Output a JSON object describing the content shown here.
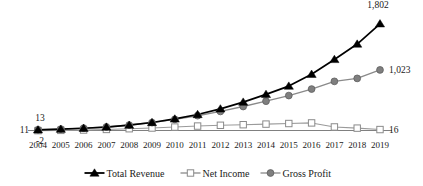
{
  "chart_data": {
    "type": "line",
    "title": "",
    "subtitle": "",
    "xlabel": "",
    "ylabel": "",
    "grid": false,
    "legend_position": "bottom",
    "categories": [
      "2004",
      "2005",
      "2006",
      "2007",
      "2008",
      "2009",
      "2010",
      "2011",
      "2012",
      "2013",
      "2014",
      "2015",
      "2016",
      "2017",
      "2018",
      "2019"
    ],
    "xlim": [
      "2004",
      "2019"
    ],
    "ylim": [
      -100,
      1900
    ],
    "series": [
      {
        "name": "Total Revenue",
        "marker": "triangle",
        "color": "#000000",
        "values": [
          11,
          22,
          38,
          58,
          90,
          135,
          195,
          270,
          365,
          480,
          610,
          750,
          950,
          1200,
          1460,
          1802
        ]
      },
      {
        "name": "Net Income",
        "marker": "square",
        "color": "#9a9a9a",
        "values": [
          -2,
          2,
          8,
          18,
          30,
          42,
          58,
          75,
          88,
          98,
          108,
          118,
          128,
          60,
          40,
          16
        ]
      },
      {
        "name": "Gross Profit",
        "marker": "circle",
        "color": "#7f7f7f",
        "values": [
          13,
          24,
          40,
          60,
          92,
          134,
          188,
          250,
          322,
          405,
          495,
          590,
          700,
          830,
          880,
          1023
        ]
      }
    ],
    "point_labels": [
      {
        "id": "revenue-start",
        "series": "Total Revenue",
        "category": "2004",
        "text": "11",
        "position": "left"
      },
      {
        "id": "gross-start",
        "series": "Gross Profit",
        "category": "2004",
        "text": "13",
        "position": "above"
      },
      {
        "id": "net-start",
        "series": "Net Income",
        "category": "2004",
        "text": "-2",
        "position": "below"
      },
      {
        "id": "revenue-end",
        "series": "Total Revenue",
        "category": "2019",
        "text": "1,802",
        "position": "above"
      },
      {
        "id": "gross-end",
        "series": "Gross Profit",
        "category": "2019",
        "text": "1,023",
        "position": "right"
      },
      {
        "id": "net-end",
        "series": "Net Income",
        "category": "2019",
        "text": "16",
        "position": "right"
      }
    ],
    "legend": [
      {
        "label": "Total Revenue",
        "marker": "triangle",
        "color": "#000000"
      },
      {
        "label": "Net Income",
        "marker": "square",
        "color": "#9a9a9a"
      },
      {
        "label": "Gross Profit",
        "marker": "circle",
        "color": "#7f7f7f"
      }
    ]
  }
}
